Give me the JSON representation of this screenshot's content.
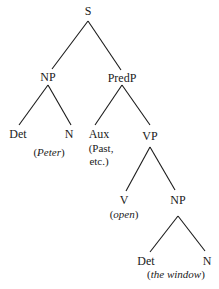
{
  "tree": {
    "root": "S",
    "nodes": {
      "s": "S",
      "np_subj": "NP",
      "predp": "PredP",
      "det_subj": "Det",
      "n_subj": "N",
      "aux": "Aux",
      "vp": "VP",
      "v": "V",
      "np_obj": "NP",
      "det_obj": "Det",
      "n_obj": "N"
    },
    "glosses": {
      "subj": {
        "open": "(",
        "text": "Peter",
        "close": ")"
      },
      "aux_line1": "(Past,",
      "aux_line2": "etc.)",
      "verb": {
        "open": "(",
        "text": "open",
        "close": ")"
      },
      "obj": {
        "open": "(",
        "text": "the window",
        "close": ")"
      }
    }
  }
}
